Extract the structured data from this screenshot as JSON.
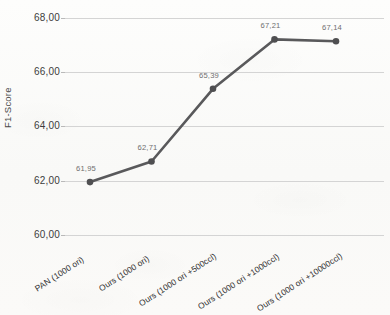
{
  "chart_data": {
    "type": "line",
    "title": "",
    "xlabel": "",
    "ylabel": "F1-Score",
    "ylim": [
      60.0,
      68.0
    ],
    "ytick_labels": [
      "68,00",
      "66,00",
      "64,00",
      "62,00",
      "60,00"
    ],
    "ytick_values": [
      68.0,
      66.0,
      64.0,
      62.0,
      60.0
    ],
    "grid": true,
    "legend": "none",
    "decimal_separator": ",",
    "categories": [
      "PAN (1000 ori)",
      "Ours (1000 ori)",
      "Ours (1000 ori +500ccl)",
      "Ours (1000 ori +1000ccl)",
      "Ours (1000 ori +10000ccl)"
    ],
    "values": [
      61.95,
      62.71,
      65.39,
      67.21,
      67.14
    ],
    "point_labels": [
      "61,95",
      "62,71",
      "65,39",
      "67,21",
      "67,14"
    ],
    "series": [
      {
        "name": "F1-Score",
        "values": [
          61.95,
          62.71,
          65.39,
          67.21,
          67.14
        ],
        "color": "#59595b",
        "marker": "circle"
      }
    ],
    "colors": {
      "line": "#59595b",
      "marker": "#4f4f51",
      "gridline": "#d4d4d4",
      "axis_text": "#3c3c3c",
      "data_label_text": "#6e6e6e",
      "background": "#fbfbfa"
    }
  },
  "axes": {
    "y_title": "F1-Score"
  }
}
